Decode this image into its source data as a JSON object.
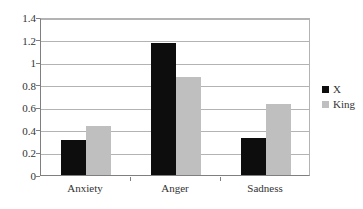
{
  "chart_data": {
    "type": "bar",
    "title": "",
    "subtitle": "",
    "xlabel": "",
    "ylabel": "",
    "categories": [
      "Anxiety",
      "Anger",
      "Sadness"
    ],
    "series": [
      {
        "name": "X",
        "color": "#0D0D0D",
        "values": [
          0.31,
          1.17,
          0.33
        ]
      },
      {
        "name": "King",
        "color": "#BFBFBF",
        "values": [
          0.43,
          0.87,
          0.63
        ]
      }
    ],
    "ylim": [
      0,
      1.4
    ],
    "ytick_labels": [
      "0",
      "0.2",
      "0.4",
      "0.6",
      "0.8",
      "1",
      "1.2",
      "1.4"
    ],
    "ytick_values": [
      0,
      0.2,
      0.4,
      0.6,
      0.8,
      1,
      1.2,
      1.4
    ],
    "grid": true,
    "grid_axis": "y",
    "legend_position": "right",
    "plot_background": "#FFFFFF",
    "grid_color": "#B3B3B3",
    "axis_color": "#7F7F7F"
  }
}
